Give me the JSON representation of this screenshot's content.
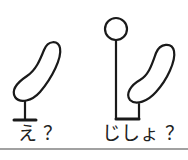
{
  "figures": [
    {
      "id": "left",
      "label": "え",
      "question_mark": "？",
      "description": "bean-shaped object on a T-stand"
    },
    {
      "id": "right",
      "label": "じしょ",
      "question_mark": "？",
      "description": "bean-shaped object beside a circle on a pole joined by a base bracket"
    }
  ],
  "colors": {
    "stroke": "#1a1a1a",
    "background": "#ffffff"
  }
}
